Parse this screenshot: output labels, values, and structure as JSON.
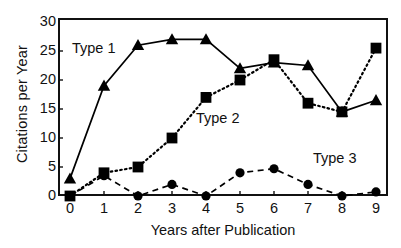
{
  "chart_data": {
    "type": "line",
    "title": "",
    "subtitle": "",
    "xlabel": "Years after Publication",
    "ylabel": "Citations per Year",
    "x": [
      0,
      1,
      2,
      3,
      4,
      5,
      6,
      7,
      8,
      9
    ],
    "categories": [
      "0",
      "1",
      "2",
      "3",
      "4",
      "5",
      "6",
      "7",
      "8",
      "9"
    ],
    "xticklabels": [
      "0",
      "1",
      "2",
      "3",
      "4",
      "5",
      "6",
      "7",
      "8",
      "9"
    ],
    "yticklabels": [
      "0",
      "5",
      "10",
      "15",
      "20",
      "25",
      "30"
    ],
    "yticks": [
      0,
      5,
      10,
      15,
      20,
      25,
      30
    ],
    "xlim": [
      0,
      9
    ],
    "ylim": [
      0,
      30
    ],
    "grid": false,
    "legend_position": "inline-annotations",
    "series": [
      {
        "name": "Type 1",
        "marker": "triangle",
        "linestyle": "solid",
        "color": "#000000",
        "values": [
          3,
          19,
          26,
          27,
          27,
          22,
          23,
          22.5,
          14.5,
          16.5
        ]
      },
      {
        "name": "Type 2",
        "marker": "square",
        "linestyle": "dotted",
        "color": "#000000",
        "values": [
          0,
          4,
          5,
          10,
          17,
          20,
          23.5,
          16,
          14.5,
          25.5
        ]
      },
      {
        "name": "Type 3",
        "marker": "circle",
        "linestyle": "dashed",
        "color": "#000000",
        "values": [
          0,
          3.5,
          0,
          2,
          0,
          4,
          4.7,
          2,
          0,
          0.7
        ]
      }
    ],
    "annotations": [
      {
        "text": "Type 1",
        "series": "Type 1"
      },
      {
        "text": "Type 2",
        "series": "Type 2"
      },
      {
        "text": "Type 3",
        "series": "Type 3"
      }
    ]
  }
}
